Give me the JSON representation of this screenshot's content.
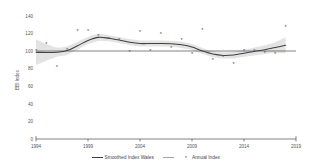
{
  "chart_data": {
    "type": "scatter",
    "title": "",
    "subtitle": "",
    "xlabel": "",
    "ylabel": "BBI Index",
    "xlim": [
      1994,
      2019
    ],
    "ylim": [
      0,
      140
    ],
    "grid": false,
    "legend_position": "bottom",
    "x_ticks": [
      1994,
      1999,
      2004,
      2009,
      2014,
      2019
    ],
    "x_tick_labels": [
      "1994",
      "1999",
      "2004",
      "2009",
      "2014",
      "2019"
    ],
    "y_ticks": [
      0,
      20,
      40,
      60,
      80,
      100,
      120,
      140
    ],
    "y_tick_labels": [
      "0",
      "20",
      "40",
      "60",
      "80",
      "100",
      "120",
      "140"
    ],
    "reference_line": {
      "name": "Baseline 100",
      "value": 100
    },
    "x": [
      1994,
      1995,
      1996,
      1997,
      1998,
      1999,
      2000,
      2001,
      2002,
      2003,
      2004,
      2005,
      2006,
      2007,
      2008,
      2009,
      2010,
      2011,
      2012,
      2013,
      2014,
      2015,
      2016,
      2017,
      2018
    ],
    "series": [
      {
        "name": "Annual Index",
        "type": "scatter",
        "marker": "asterisk",
        "color": "#555555",
        "values": [
          100.0,
          107.5,
          82.0,
          101.5,
          123.0,
          122.5,
          116.5,
          113.5,
          112.0,
          99.0,
          121.0,
          99.5,
          119.0,
          103.5,
          112.5,
          97.0,
          123.5,
          90.0,
          93.5,
          85.5,
          99.5,
          100.0,
          98.0,
          96.5,
          127.5
        ]
      },
      {
        "name": "Smoothed Index Wales",
        "type": "line",
        "color": "#3f3f3f",
        "band_color": "#cccccc",
        "values": [
          98.5,
          98.3,
          98.6,
          100.5,
          106.0,
          112.0,
          115.5,
          114.5,
          112.5,
          110.0,
          108.5,
          108.5,
          108.5,
          108.2,
          107.0,
          104.5,
          100.0,
          96.5,
          95.0,
          95.5,
          97.5,
          99.5,
          101.5,
          104.0,
          106.5
        ]
      }
    ],
    "confidence_band": {
      "name": "Smoothed Index confidence band",
      "upper": [
        113.0,
        108.0,
        104.0,
        105.5,
        110.5,
        116.0,
        119.5,
        118.0,
        116.0,
        113.5,
        112.0,
        112.0,
        112.0,
        111.5,
        110.5,
        108.0,
        103.5,
        100.0,
        98.5,
        99.5,
        101.5,
        104.0,
        106.5,
        110.0,
        115.5
      ],
      "lower": [
        84.0,
        89.0,
        93.5,
        95.5,
        101.5,
        108.0,
        111.5,
        111.0,
        109.0,
        106.5,
        105.0,
        105.0,
        105.0,
        105.0,
        103.5,
        101.0,
        96.5,
        93.0,
        91.5,
        91.5,
        93.5,
        95.0,
        96.5,
        98.0,
        97.5
      ]
    }
  },
  "legend": {
    "entries": [
      {
        "label": "Smoothed Index Wales",
        "marker": "line"
      },
      {
        "label": "Annual Index",
        "marker": "asterisk"
      }
    ]
  },
  "axes": {
    "y_title": "BBI Index"
  }
}
